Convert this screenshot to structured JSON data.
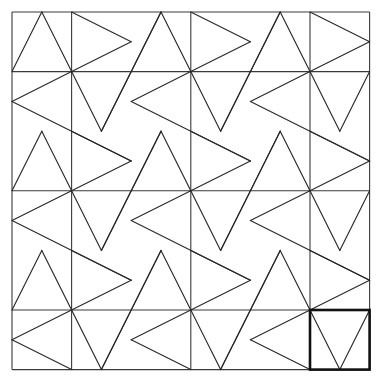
{
  "diagram": {
    "origin_px": [
      12,
      12
    ],
    "unit_px": 59.6,
    "extent_units": 6,
    "colors": {
      "background": "#ffffff",
      "line": "#2a2a2a",
      "grid": "#3a3a3a",
      "highlight": "#111111"
    },
    "grid": {
      "verticals": [
        0,
        1,
        3,
        5,
        6
      ],
      "horizontals": [
        0,
        1,
        3,
        5,
        6
      ]
    },
    "star_nodes": [
      1,
      3,
      5
    ],
    "highlight_square": {
      "x": 5,
      "y": 5,
      "w": 1,
      "h": 1
    }
  }
}
